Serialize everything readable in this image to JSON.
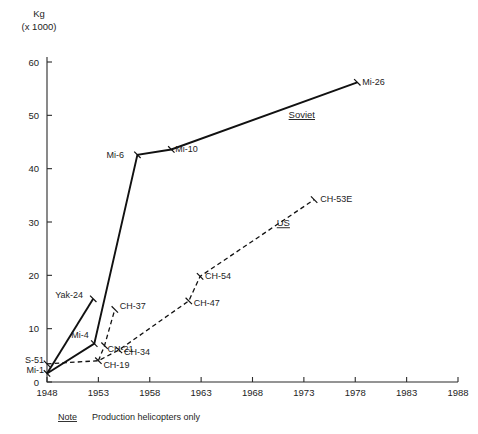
{
  "chart_data": {
    "type": "line",
    "title": "",
    "subtitle": "",
    "ylabel_line1": "Kg",
    "ylabel_line2": "(x 1000)",
    "xlabel": "",
    "xlim": [
      1948,
      1988
    ],
    "ylim": [
      0,
      60
    ],
    "grid": false,
    "legend_position": "inline-annotations",
    "x_ticks": [
      1948,
      1953,
      1958,
      1963,
      1968,
      1973,
      1978,
      1983,
      1988
    ],
    "y_ticks": [
      0,
      10,
      20,
      30,
      40,
      50,
      60
    ],
    "x_tick_labels": [
      "1948",
      "1953",
      "1958",
      "1963",
      "1968",
      "1973",
      "1978",
      "1983",
      "1988"
    ],
    "y_tick_labels": [
      "0",
      "10",
      "20",
      "30",
      "40",
      "50",
      "60"
    ],
    "series": [
      {
        "name": "Soviet",
        "style": "solid",
        "label": "Soviet",
        "label_x": 1972.8,
        "label_y": 49.5,
        "points": [
          {
            "label": "Mi-1",
            "x": 1948.0,
            "y": 1.6,
            "label_dx": -4,
            "label_dy": 3,
            "anchor": "end"
          },
          {
            "label": "Mi-4",
            "x": 1952.6,
            "y": 7.2,
            "label_dx": -23,
            "label_dy": -6,
            "anchor": "start"
          },
          {
            "label": "Mi-6",
            "x": 1956.8,
            "y": 42.6,
            "label_dx": -31,
            "label_dy": 3,
            "anchor": "start"
          },
          {
            "label": "Mi-10",
            "x": 1960.1,
            "y": 43.6,
            "label_dx": 4,
            "label_dy": 3,
            "anchor": "start"
          },
          {
            "label": "Mi-26",
            "x": 1978.2,
            "y": 56.2,
            "label_dx": 5,
            "label_dy": 3,
            "anchor": "start"
          }
        ]
      },
      {
        "name": "Soviet branch Yak-24",
        "style": "solid",
        "label": "",
        "points": [
          {
            "label": "Mi-1",
            "x": 1948.0,
            "y": 1.6,
            "show_label": false
          },
          {
            "label": "Yak-24",
            "x": 1952.5,
            "y": 15.6,
            "label_dx": -38,
            "label_dy": -1,
            "anchor": "start"
          }
        ]
      },
      {
        "name": "US",
        "style": "dashed",
        "label": "US",
        "label_x": 1971.0,
        "label_y": 29.2,
        "points": [
          {
            "label": "S-51",
            "x": 1948.0,
            "y": 3.4,
            "label_dx": -4,
            "label_dy": -2,
            "anchor": "end"
          },
          {
            "label": "CH-19",
            "x": 1953.0,
            "y": 4.0,
            "label_dx": 5,
            "label_dy": 7,
            "anchor": "start"
          },
          {
            "label": "CH-34",
            "x": 1955.0,
            "y": 6.0,
            "label_dx": 5,
            "label_dy": 5,
            "anchor": "start"
          },
          {
            "label": "CH-47",
            "x": 1961.8,
            "y": 15.2,
            "label_dx": 5,
            "label_dy": 5,
            "anchor": "start"
          },
          {
            "label": "CH-54",
            "x": 1962.9,
            "y": 19.8,
            "label_dx": 5,
            "label_dy": 3,
            "anchor": "start"
          },
          {
            "label": "CH-53E",
            "x": 1974.0,
            "y": 34.2,
            "label_dx": 6,
            "label_dy": 2,
            "anchor": "start"
          }
        ]
      },
      {
        "name": "US branch CH-37",
        "style": "dashed",
        "label": "",
        "points": [
          {
            "label": "CH-19",
            "x": 1953.0,
            "y": 4.0,
            "show_label": false
          },
          {
            "label": "CH-21",
            "x": 1953.6,
            "y": 6.8,
            "label_dx": 3,
            "label_dy": 6,
            "anchor": "start"
          },
          {
            "label": "CH-37",
            "x": 1954.6,
            "y": 13.6,
            "label_dx": 5,
            "label_dy": 0,
            "anchor": "start"
          }
        ]
      }
    ],
    "annotations": [
      {
        "name": "note-label",
        "text": "Note",
        "underline": true
      },
      {
        "name": "note-body",
        "text": "Production helicopters only",
        "underline": false
      }
    ]
  },
  "note": {
    "word": "Note",
    "text": "Production helicopters only"
  },
  "axis": {
    "y_title_line1": "Kg",
    "y_title_line2": "(x 1000)"
  }
}
